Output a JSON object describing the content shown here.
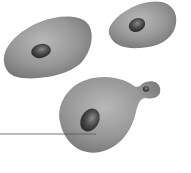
{
  "figure": {
    "title": "",
    "colors": {
      "background": "#ffffff",
      "cell_light": "#b8b8b8",
      "cell_mid": "#979797",
      "cell_dark": "#7a7a7a",
      "nucleus_light": "#8a8a8a",
      "nucleus_dark": "#2e2e2e",
      "leader_line": "#555555"
    },
    "cells": [
      {
        "id": "cell-left",
        "has_nucleus": true,
        "has_bud": false
      },
      {
        "id": "cell-top-right",
        "has_nucleus": true,
        "has_bud": false
      },
      {
        "id": "cell-bottom-budding",
        "has_nucleus": true,
        "has_bud": true
      }
    ],
    "leader_line": {
      "x1": 0,
      "y1": 134,
      "x2": 96,
      "y2": 134,
      "label": ""
    }
  }
}
